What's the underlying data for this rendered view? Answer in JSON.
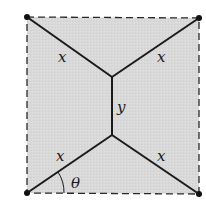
{
  "diagram": {
    "type": "network-of-segments-in-square",
    "colors": {
      "fill": "#d9d9d9",
      "border": "#2a2a2a",
      "segment": "#1a1a1a",
      "vertex": "#111111"
    },
    "square": {
      "corners": {
        "top_left": [
          27,
          17
        ],
        "top_right": [
          199,
          18
        ],
        "bottom_left": [
          27,
          193
        ],
        "bottom_right": [
          199,
          194
        ]
      },
      "border_style": "dashed"
    },
    "junctions": {
      "upper": [
        112,
        77
      ],
      "lower": [
        112,
        135
      ]
    },
    "labels": {
      "top_left_segment": "x",
      "top_right_segment": "x",
      "middle_segment": "y",
      "bottom_left_segment": "x",
      "bottom_right_segment": "x",
      "angle": "θ"
    }
  }
}
